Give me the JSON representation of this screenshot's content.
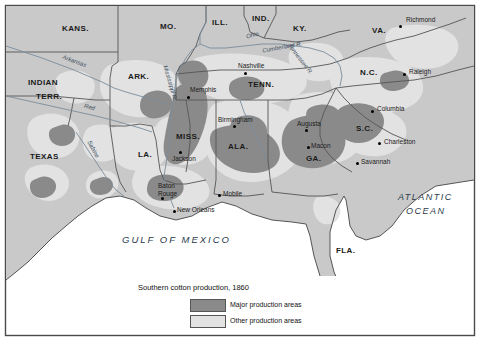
{
  "map": {
    "title": "Southern cotton production, 1860",
    "frame": {
      "border_color": "#4a4a4a",
      "background_color": "#ffffff"
    },
    "colors": {
      "land": "#c9c9c9",
      "major_production": "#8a8a8a",
      "other_production": "#e2e2e2",
      "water": "#ffffff",
      "border": "#555555",
      "river": "#7b8c9c",
      "text": "#1a1a1a"
    },
    "legend": {
      "title": "Southern cotton production, 1860",
      "items": [
        {
          "label": "Major production areas",
          "color": "#8a8a8a"
        },
        {
          "label": "Other production areas",
          "color": "#e2e2e2"
        }
      ]
    },
    "states": [
      {
        "name": "KANS.",
        "x": 78,
        "y": 28
      },
      {
        "name": "MO.",
        "x": 168,
        "y": 26
      },
      {
        "name": "ILL.",
        "x": 222,
        "y": 22
      },
      {
        "name": "IND.",
        "x": 262,
        "y": 18
      },
      {
        "name": "KY.",
        "x": 300,
        "y": 28
      },
      {
        "name": "VA.",
        "x": 374,
        "y": 30
      },
      {
        "name": "INDIAN",
        "x": 40,
        "y": 83
      },
      {
        "name": "TERR.",
        "x": 44,
        "y": 95
      },
      {
        "name": "ARK.",
        "x": 140,
        "y": 78
      },
      {
        "name": "TENN.",
        "x": 262,
        "y": 84
      },
      {
        "name": "N.C.",
        "x": 368,
        "y": 74
      },
      {
        "name": "S.C.",
        "x": 363,
        "y": 130
      },
      {
        "name": "MISS.",
        "x": 190,
        "y": 138
      },
      {
        "name": "ALA.",
        "x": 238,
        "y": 146
      },
      {
        "name": "GA.",
        "x": 312,
        "y": 158
      },
      {
        "name": "TEXAS",
        "x": 44,
        "y": 158
      },
      {
        "name": "LA.",
        "x": 147,
        "y": 155
      },
      {
        "name": "FLA.",
        "x": 345,
        "y": 251
      }
    ],
    "cities": [
      {
        "name": "Richmond",
        "x": 404,
        "y": 20,
        "dot_x": 400,
        "dot_y": 26,
        "anchor": "left"
      },
      {
        "name": "Nashville",
        "x": 248,
        "y": 66,
        "dot_x": 245,
        "dot_y": 73,
        "anchor": "left"
      },
      {
        "name": "Raleigh",
        "x": 410,
        "y": 71,
        "dot_x": 404,
        "dot_y": 74,
        "anchor": "left"
      },
      {
        "name": "Memphis",
        "x": 192,
        "y": 90,
        "dot_x": 188,
        "dot_y": 97,
        "anchor": "left"
      },
      {
        "name": "Columbia",
        "x": 378,
        "y": 108,
        "dot_x": 372,
        "dot_y": 111,
        "anchor": "left"
      },
      {
        "name": "Birmingham",
        "x": 222,
        "y": 119,
        "dot_x": 234,
        "dot_y": 126,
        "anchor": "left"
      },
      {
        "name": "Augusta",
        "x": 302,
        "y": 122,
        "dot_x": 306,
        "dot_y": 130,
        "anchor": "left"
      },
      {
        "name": "Charleston",
        "x": 383,
        "y": 140,
        "dot_x": 379,
        "dot_y": 143,
        "anchor": "left"
      },
      {
        "name": "Macon",
        "x": 312,
        "y": 140,
        "dot_x": 308,
        "dot_y": 147,
        "anchor": "left"
      },
      {
        "name": "Jackson",
        "x": 177,
        "y": 155,
        "dot_x": 180,
        "dot_y": 152,
        "anchor": "left"
      },
      {
        "name": "Savannah",
        "x": 361,
        "y": 160,
        "dot_x": 357,
        "dot_y": 163,
        "anchor": "left"
      },
      {
        "name": "Baton",
        "x": 163,
        "y": 186,
        "dot_x": 162,
        "dot_y": 198,
        "anchor": "left"
      },
      {
        "name": "Rouge",
        "x": 163,
        "y": 194,
        "dot_x": null,
        "dot_y": null,
        "anchor": "left"
      },
      {
        "name": "Mobile",
        "x": 224,
        "y": 192,
        "dot_x": 219,
        "dot_y": 195,
        "anchor": "left"
      },
      {
        "name": "New Orleans",
        "x": 178,
        "y": 208,
        "dot_x": 174,
        "dot_y": 211,
        "anchor": "left"
      }
    ],
    "rivers": [
      {
        "name": "Ohio",
        "x": 254,
        "y": 38,
        "rotate": -18
      },
      {
        "name": "Cumberland  R.",
        "x": 272,
        "y": 48,
        "rotate": -12
      },
      {
        "name": "Tennessee  R.",
        "x": 292,
        "y": 62,
        "rotate": 55
      },
      {
        "name": "Arkansas",
        "x": 82,
        "y": 62,
        "rotate": 38
      },
      {
        "name": "Red",
        "x": 88,
        "y": 108,
        "rotate": 18
      },
      {
        "name": "Mississippi  R.",
        "x": 160,
        "y": 88,
        "rotate": 72
      },
      {
        "name": "Sabine",
        "x": 88,
        "y": 150,
        "rotate": 68
      }
    ],
    "water_labels": [
      {
        "name": "ATLANTIC",
        "x": 404,
        "y": 197
      },
      {
        "name": "OCEAN",
        "x": 412,
        "y": 211
      },
      {
        "name": "GULF  OF  MEXICO",
        "x": 130,
        "y": 240
      }
    ]
  }
}
